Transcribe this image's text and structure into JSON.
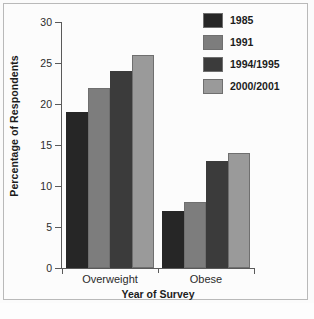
{
  "chart_data": {
    "type": "bar",
    "title": "",
    "xlabel": "Year of Survey",
    "ylabel": "Percentage of Respondents",
    "categories": [
      "Overweight",
      "Obese"
    ],
    "series": [
      {
        "name": "1985",
        "values": [
          19,
          7
        ],
        "color": "#262626"
      },
      {
        "name": "1991",
        "values": [
          22,
          8
        ],
        "color": "#7d7d7d"
      },
      {
        "name": "1994/1995",
        "values": [
          24,
          13
        ],
        "color": "#3b3b3b"
      },
      {
        "name": "2000/2001",
        "values": [
          26,
          14
        ],
        "color": "#9a9a9a"
      }
    ],
    "ylim": [
      0,
      30
    ],
    "yticks": [
      0,
      5,
      10,
      15,
      20,
      25,
      30
    ],
    "ytick_labels": [
      "0",
      "5",
      "10",
      "15",
      "20",
      "25",
      "30"
    ],
    "grid": false,
    "legend_position": "top-right"
  }
}
